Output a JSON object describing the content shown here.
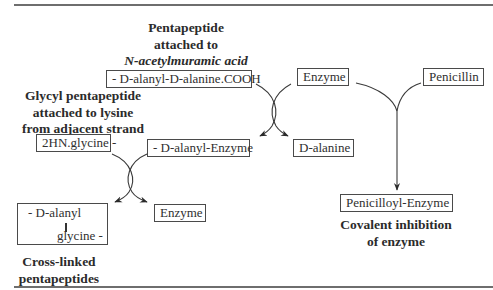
{
  "diagram": {
    "labels": {
      "pentapeptide_line1": "Pentapeptide",
      "pentapeptide_line2": "attached to",
      "pentapeptide_line3": "N-acetylmuramic acid",
      "glycyl_line1": "Glycyl pentapeptide",
      "glycyl_line2": "attached to lysine",
      "glycyl_line3": "from adjacent strand",
      "crosslinked_line1": "Cross-linked",
      "crosslinked_line2": "pentapeptides",
      "covalent_line1": "Covalent inhibition",
      "covalent_line2": "of enzyme"
    },
    "boxes": {
      "d_alanyl_d_alanine": "- D-alanyl-D-alanine.COOH",
      "enzyme_top": "Enzyme",
      "penicillin": "Penicillin",
      "glycine": "2HN.glycine -",
      "d_alanyl_enzyme": "- D-alanyl-Enzyme",
      "d_alanine": "D-alanine",
      "crosslink_top": "- D-alanyl",
      "crosslink_bottom": "glycine -",
      "enzyme_bottom": "Enzyme",
      "penicilloyl_enzyme": "Penicilloyl-Enzyme"
    },
    "colors": {
      "line": "#3a3a3a",
      "rule": "#6e6e6e",
      "text": "#2b2b2b"
    }
  }
}
